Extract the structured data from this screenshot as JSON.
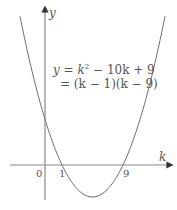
{
  "chart_data": {
    "type": "line",
    "title": "",
    "xlabel": "k",
    "ylabel": "y",
    "equation_line1": "y = k² − 10k + 9",
    "equation_line2": "= (k − 1)(k − 9)",
    "function": "y = k^2 - 10k + 9",
    "roots": [
      1,
      9
    ],
    "y_intercept": 9,
    "vertex": {
      "k": 5,
      "y": -16
    },
    "x_tick_labels": [
      "0",
      "1",
      "9"
    ],
    "grid": false,
    "legend": null,
    "series": [
      {
        "name": "y = k^2 - 10k + 9",
        "x": [
          -2,
          -1,
          0,
          1,
          2,
          3,
          4,
          5,
          6,
          7,
          8,
          9,
          10,
          11,
          12
        ],
        "values": [
          33,
          20,
          9,
          0,
          -7,
          -12,
          -15,
          -16,
          -15,
          -12,
          -7,
          0,
          9,
          20,
          33
        ]
      }
    ],
    "colors": {
      "curve": "#6e6e6e",
      "axes": "#8a8a8a",
      "text": "#555555"
    }
  },
  "labels": {
    "y_axis": "y",
    "k_axis": "k",
    "origin": "0",
    "root1": "1",
    "root2": "9",
    "eq_line1_prefix": "y = k",
    "eq_line1_sup": "2",
    "eq_line1_suffix": " − 10k + 9",
    "eq_line2": "= (k − 1)(k − 9)"
  }
}
